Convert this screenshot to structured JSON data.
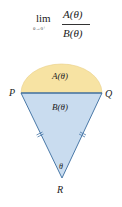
{
  "formula": {
    "lim": "lim",
    "subscript": "θ→0⁺",
    "numerator": "A(θ)",
    "denominator": "B(θ)"
  },
  "diagram": {
    "points": {
      "P": "P",
      "Q": "Q",
      "R": "R"
    },
    "region_labels": {
      "semicircle": "A(θ)",
      "triangle": "B(θ)",
      "angle": "θ"
    },
    "colors": {
      "semicircle_fill": "#f7e3a3",
      "triangle_fill": "#c9dcef",
      "stroke": "#4a79a8"
    }
  }
}
